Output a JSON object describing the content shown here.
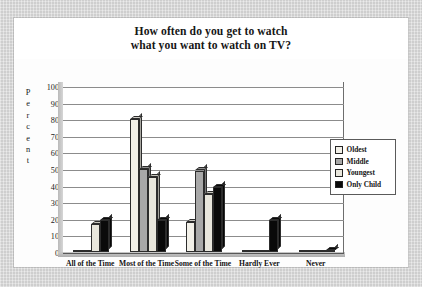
{
  "title": {
    "line1": "How often do you get to watch",
    "line2": "what you want to watch on TV?"
  },
  "axis": {
    "ylabel_letters": [
      "P",
      "e",
      "r",
      "c",
      "e",
      "n",
      "t"
    ],
    "yticks": [
      "100",
      "90",
      "80",
      "70",
      "60",
      "50",
      "40",
      "30",
      "20",
      "10",
      "0"
    ]
  },
  "legend": {
    "items": [
      {
        "label": "Oldest",
        "color": "#f2f0e8"
      },
      {
        "label": "Middle",
        "color": "#a8a8a8"
      },
      {
        "label": "Youngest",
        "color": "#e8e6dc"
      },
      {
        "label": "Only Child",
        "color": "#0a0a0a"
      }
    ]
  },
  "chart_data": {
    "type": "bar",
    "title": "How often do you get to watch what you want to watch on TV?",
    "xlabel": "",
    "ylabel": "Percent",
    "ylim": [
      0,
      100
    ],
    "ytick_step": 10,
    "grid": true,
    "legend_position": "right",
    "categories": [
      "All of the Time",
      "Most of the Time",
      "Some of the Time",
      "Hardly Ever",
      "Never"
    ],
    "series": [
      {
        "name": "Oldest",
        "color": "#f2f0e8",
        "values": [
          0,
          80,
          18,
          0,
          0
        ]
      },
      {
        "name": "Middle",
        "color": "#a8a8a8",
        "values": [
          0,
          50,
          49,
          0,
          0
        ]
      },
      {
        "name": "Youngest",
        "color": "#e8e6dc",
        "values": [
          17,
          45,
          35,
          0,
          0
        ]
      },
      {
        "name": "Only Child",
        "color": "#0a0a0a",
        "values": [
          19,
          19,
          39,
          19,
          1
        ]
      }
    ]
  }
}
